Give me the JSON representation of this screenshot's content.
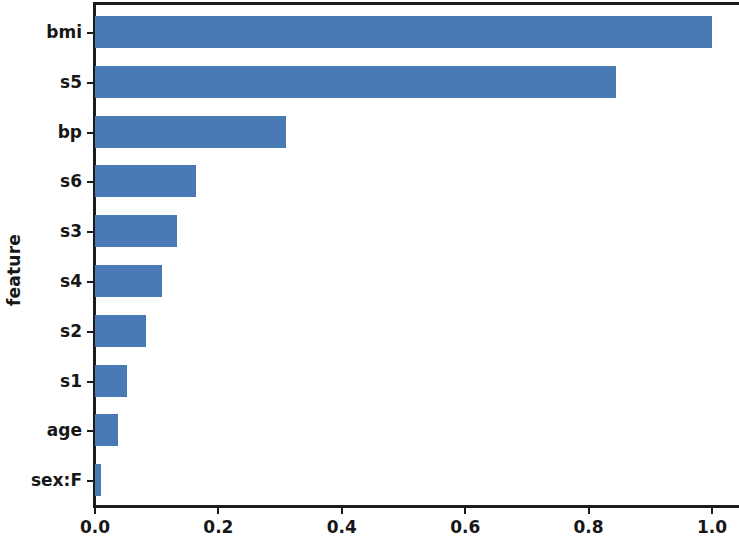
{
  "chart_data": {
    "type": "bar",
    "orientation": "horizontal",
    "title": "",
    "xlabel": "",
    "ylabel": "feature",
    "categories": [
      "bmi",
      "s5",
      "bp",
      "s6",
      "s3",
      "s4",
      "s2",
      "s1",
      "age",
      "sex:F"
    ],
    "values": [
      1.0,
      0.845,
      0.31,
      0.164,
      0.133,
      0.108,
      0.083,
      0.052,
      0.037,
      0.01
    ],
    "xlim": [
      0.0,
      1.04
    ],
    "ylim_categories_top_to_bottom": true,
    "xticks": [
      0.0,
      0.2,
      0.4,
      0.6,
      0.8,
      1.0
    ],
    "xticklabels": [
      "0.0",
      "0.2",
      "0.4",
      "0.6",
      "0.8",
      "1.0"
    ],
    "grid": false,
    "legend": null,
    "bar_color": "#4a7ab5",
    "background_color": "#ffffff",
    "axis_color": "#1b1b1b"
  }
}
